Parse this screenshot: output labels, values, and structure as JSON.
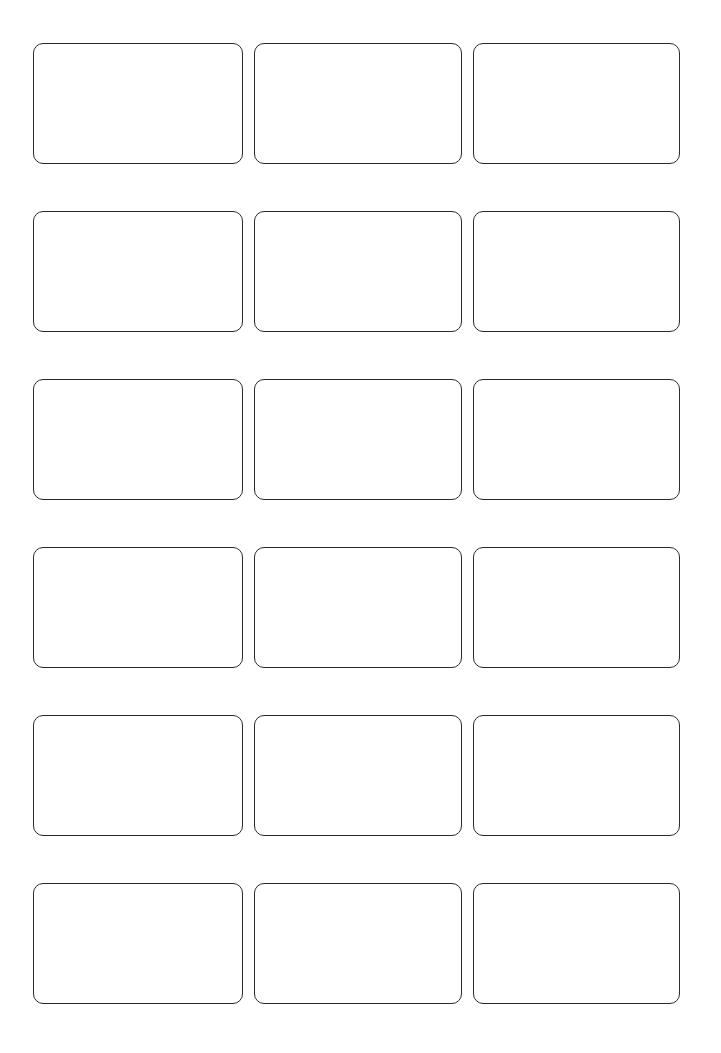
{
  "page": {
    "background_color": "#ffffff"
  },
  "grid": {
    "rows": 6,
    "columns": 3,
    "cell_border_color": "#2b2b2b",
    "cell_background_color": "#ffffff",
    "cells": [
      {
        "content": ""
      },
      {
        "content": ""
      },
      {
        "content": ""
      },
      {
        "content": ""
      },
      {
        "content": ""
      },
      {
        "content": ""
      },
      {
        "content": ""
      },
      {
        "content": ""
      },
      {
        "content": ""
      },
      {
        "content": ""
      },
      {
        "content": ""
      },
      {
        "content": ""
      },
      {
        "content": ""
      },
      {
        "content": ""
      },
      {
        "content": ""
      },
      {
        "content": ""
      },
      {
        "content": ""
      },
      {
        "content": ""
      }
    ]
  }
}
